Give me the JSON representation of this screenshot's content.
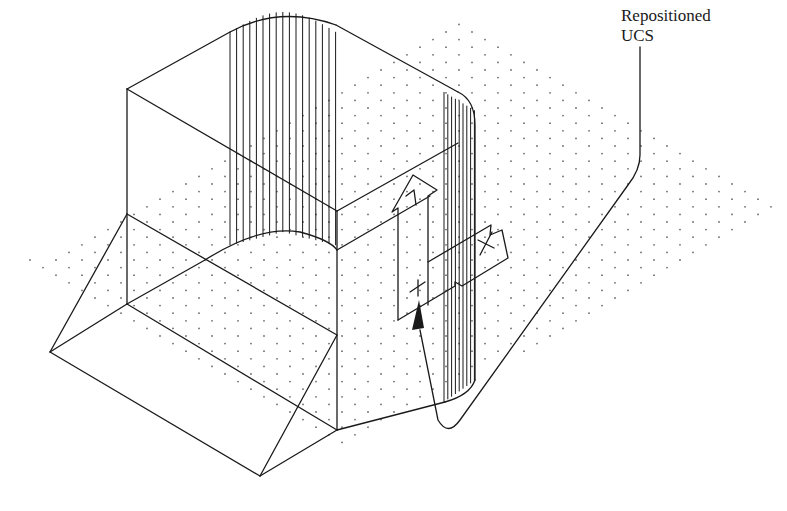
{
  "figure": {
    "type": "isometric CAD wireframe drawing"
  },
  "callout": {
    "line1": "Repositioned",
    "line2": "UCS"
  },
  "ucs_icon": {
    "x_axis_glyph": "X",
    "y_axis_glyph": "Y",
    "origin_glyph": "+"
  },
  "colors": {
    "line": "#1a1a1a",
    "grid_dot": "#6b6b6b",
    "background": "#ffffff"
  }
}
